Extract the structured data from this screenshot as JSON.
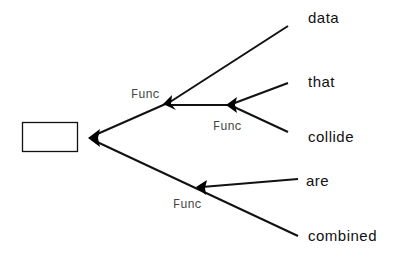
{
  "diagram": {
    "type": "tree",
    "root": {
      "label": ""
    },
    "function_label": "Func",
    "leaves": [
      {
        "label": "data"
      },
      {
        "label": "that"
      },
      {
        "label": "collide"
      },
      {
        "label": "are"
      },
      {
        "label": "combined"
      }
    ],
    "func_nodes": [
      {
        "label": "Func"
      },
      {
        "label": "Func"
      },
      {
        "label": "Func"
      }
    ],
    "colors": {
      "line": "#111111",
      "arrow": "#000000",
      "func_text": "#444444"
    }
  }
}
